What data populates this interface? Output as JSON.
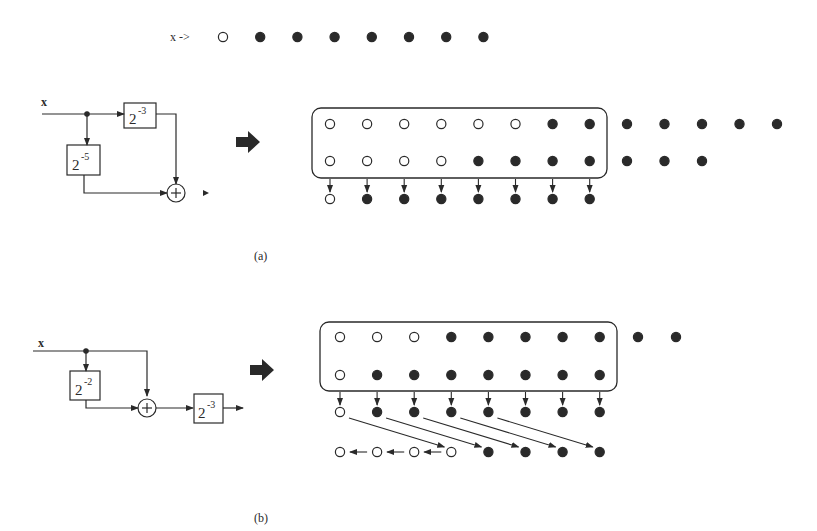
{
  "input_row": {
    "label": "x ->",
    "bits": [
      "open",
      "filled",
      "filled",
      "filled",
      "filled",
      "filled",
      "filled",
      "filled"
    ]
  },
  "panel_a": {
    "caption": "(a)",
    "input_label": "x",
    "blocks": [
      {
        "base": "2",
        "exp": "-3"
      },
      {
        "base": "2",
        "exp": "-5"
      }
    ],
    "adder_symbol": "+",
    "register_rows": [
      [
        "open",
        "open",
        "open",
        "open",
        "open",
        "open",
        "filled",
        "filled"
      ],
      [
        "open",
        "open",
        "open",
        "open",
        "filled",
        "filled",
        "filled",
        "filled"
      ]
    ],
    "overflow_rows": [
      [
        "filled",
        "filled",
        "filled",
        "filled",
        "filled"
      ],
      [
        "filled",
        "filled",
        "filled"
      ]
    ],
    "result_row": [
      "open",
      "filled",
      "filled",
      "filled",
      "filled",
      "filled",
      "filled",
      "filled"
    ]
  },
  "panel_b": {
    "caption": "(b)",
    "input_label": "x",
    "blocks": [
      {
        "base": "2",
        "exp": "-2"
      },
      {
        "base": "2",
        "exp": "-3"
      }
    ],
    "adder_symbol": "+",
    "register_rows": [
      [
        "open",
        "open",
        "open",
        "filled",
        "filled",
        "filled",
        "filled",
        "filled"
      ],
      [
        "open",
        "filled",
        "filled",
        "filled",
        "filled",
        "filled",
        "filled",
        "filled"
      ]
    ],
    "overflow_rows": [
      [
        "filled",
        "filled"
      ]
    ],
    "sum_row": [
      "open",
      "filled",
      "filled",
      "filled",
      "filled",
      "filled",
      "filled",
      "filled"
    ],
    "shifted_row": [
      "open",
      "open",
      "open",
      "open",
      "filled",
      "filled",
      "filled",
      "filled"
    ]
  },
  "colors": {
    "ink": "#2a2a2a",
    "background": "#ffffff"
  }
}
